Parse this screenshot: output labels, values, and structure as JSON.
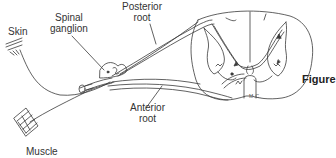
{
  "diagram": {
    "labels": {
      "skin": "Skin",
      "spinal_ganglion_line1": "Spinal",
      "spinal_ganglion_line2": "ganglion",
      "posterior_root_line1": "Posterior",
      "posterior_root_line2": "root",
      "anterior_root_line1": "Anterior",
      "anterior_root_line2": "root",
      "muscle": "Muscle"
    },
    "signature": "M.C.",
    "figure_caption": "Figure",
    "colors": {
      "line": "#3a3a3a",
      "background": "#ffffff"
    }
  }
}
